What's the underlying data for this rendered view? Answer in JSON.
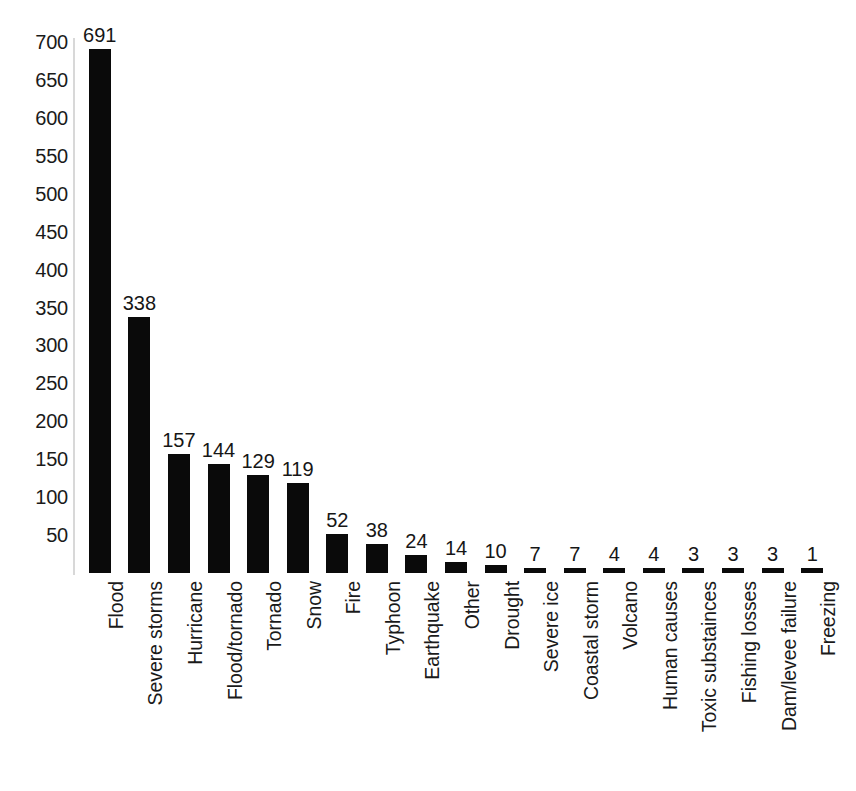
{
  "chart_data": {
    "type": "bar",
    "title": "",
    "subtitle": "",
    "xlabel": "",
    "ylabel": "",
    "orientation": "vertical",
    "grid": false,
    "legend": null,
    "legend_position": "none",
    "bar_color": "#0a0a0a",
    "background_color": "#ffffff",
    "ylim": [
      0,
      730
    ],
    "y_ticks": [
      50,
      100,
      150,
      200,
      250,
      300,
      350,
      400,
      450,
      500,
      550,
      600,
      650,
      700
    ],
    "y_tick_labels": [
      "50",
      "100",
      "150",
      "200",
      "250",
      "300",
      "350",
      "400",
      "450",
      "500",
      "550",
      "600",
      "650",
      "700"
    ],
    "value_labels_shown": true,
    "categories": [
      "Flood",
      "Severe storms",
      "Hurricane",
      "Flood/tornado",
      "Tornado",
      "Snow",
      "Fire",
      "Typhoon",
      "Earthquake",
      "Other",
      "Drought",
      "Severe ice",
      "Coastal storm",
      "Volcano",
      "Human causes",
      "Toxic substainces",
      "Fishing losses",
      "Dam/levee failure",
      "Freezing"
    ],
    "values": [
      691,
      338,
      157,
      144,
      129,
      119,
      52,
      38,
      24,
      14,
      10,
      7,
      7,
      4,
      4,
      3,
      3,
      3,
      1
    ],
    "value_label_texts": [
      "691",
      "338",
      "157",
      "144",
      "129",
      "119",
      "52",
      "38",
      "24",
      "14",
      "10",
      "7",
      "7",
      "4",
      "4",
      "3",
      "3",
      "3",
      "1"
    ]
  }
}
